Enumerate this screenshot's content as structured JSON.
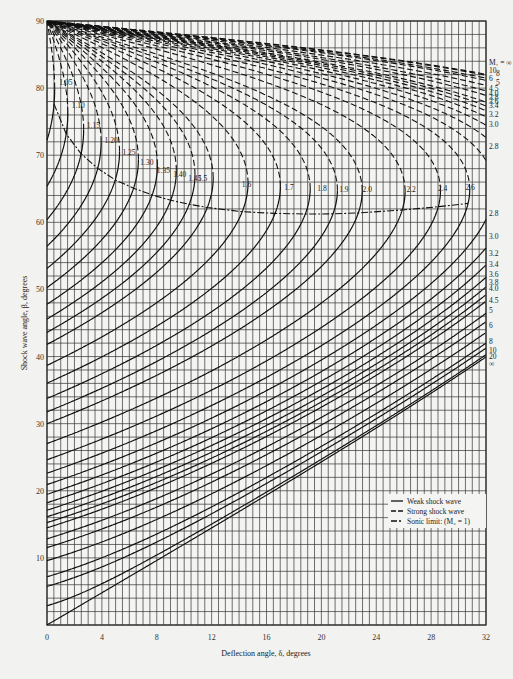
{
  "chart_data": {
    "type": "line",
    "title": "",
    "xlabel": "Deflection angle, δ, degrees",
    "ylabel": "Shock wave angle, β, degrees",
    "xlim": [
      0,
      32
    ],
    "ylim": [
      0,
      90
    ],
    "xticks": [
      0,
      4,
      8,
      12,
      16,
      20,
      24,
      28,
      32
    ],
    "yticks": [
      10,
      20,
      30,
      40,
      50,
      60,
      70,
      80,
      90
    ],
    "grid": true,
    "grid_minor_x": 0.5,
    "grid_minor_y": 1,
    "legend": {
      "position": "lower right",
      "entries": [
        {
          "label": "Weak shock wave",
          "style": "solid"
        },
        {
          "label": "Strong shock wave",
          "style": "dashed"
        },
        {
          "label": "Sonic limit: (M₂ = 1)",
          "style": "dash-dot"
        }
      ]
    },
    "curve_labels_sonic": [
      "1.05",
      "1.10",
      "1.15",
      "1.20",
      "1.25",
      "1.30",
      "1.35",
      "1.40",
      "1.45",
      "1.5",
      "1.6",
      "1.7",
      "1.8",
      "1.9",
      "2.0",
      "2.2",
      "2.4",
      "2.6"
    ],
    "curve_labels_right_strong": [
      "M₁ = ∞",
      "10",
      "8",
      "6",
      "5",
      "4.5",
      "4.0",
      "3.8",
      "3.6",
      "3.4",
      "3.2",
      "3.0",
      "2.8"
    ],
    "curve_labels_right_weak": [
      "2.8",
      "3.0",
      "3.2",
      "3.4",
      "3.6",
      "3.8",
      "4.0",
      "4.5",
      "5",
      "6",
      "8",
      "10",
      "20",
      "∞"
    ],
    "series_mach": [
      1.05,
      1.1,
      1.15,
      1.2,
      1.25,
      1.3,
      1.35,
      1.4,
      1.45,
      1.5,
      1.6,
      1.7,
      1.8,
      1.9,
      2.0,
      2.2,
      2.4,
      2.6,
      2.8,
      3.0,
      3.2,
      3.4,
      3.6,
      3.8,
      4.0,
      4.5,
      5,
      6,
      8,
      10,
      20,
      1000
    ],
    "gamma": 1.4
  }
}
